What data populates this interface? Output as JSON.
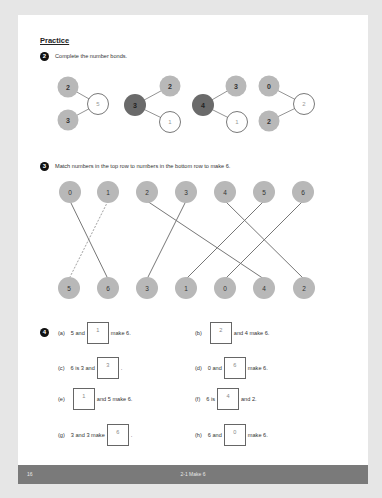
{
  "page": {
    "section_title": "Practice",
    "footer": {
      "page_number": "16",
      "title": "2-1 Make 6"
    }
  },
  "question2": {
    "number": "2",
    "instruction": "Complete the number bonds.",
    "bonds": [
      {
        "layout": "parts-left",
        "whole": "5",
        "parts": [
          "2",
          "3"
        ],
        "filled": "whole"
      },
      {
        "layout": "whole-left",
        "whole": "3",
        "parts": [
          "2",
          "1"
        ],
        "filled": "part"
      },
      {
        "layout": "whole-left",
        "whole": "4",
        "parts": [
          "3",
          "1"
        ],
        "filled": "part"
      },
      {
        "layout": "parts-left",
        "whole": "2",
        "parts": [
          "0",
          "2"
        ],
        "filled": "whole"
      }
    ]
  },
  "question3": {
    "number": "3",
    "instruction": "Match numbers in the top row to numbers in the bottom row to make 6.",
    "top_row": [
      "0",
      "1",
      "2",
      "3",
      "4",
      "5",
      "6"
    ],
    "bottom_row": [
      "5",
      "6",
      "3",
      "1",
      "0",
      "4",
      "2"
    ],
    "matches": [
      {
        "top": "0",
        "bottom": "6",
        "style": "solid"
      },
      {
        "top": "1",
        "bottom": "5",
        "style": "dashed"
      },
      {
        "top": "2",
        "bottom": "4",
        "style": "solid"
      },
      {
        "top": "3",
        "bottom": "3",
        "style": "solid"
      },
      {
        "top": "4",
        "bottom": "2",
        "style": "solid"
      },
      {
        "top": "5",
        "bottom": "1",
        "style": "solid"
      },
      {
        "top": "6",
        "bottom": "0",
        "style": "solid"
      }
    ]
  },
  "question4": {
    "number": "4",
    "items": [
      {
        "label": "(a)",
        "before": "5 and",
        "answer": "1",
        "after": "make 6."
      },
      {
        "label": "(b)",
        "before": "",
        "answer": "2",
        "after": "and 4 make 6."
      },
      {
        "label": "(c)",
        "before": "6 is 3 and",
        "answer": "3",
        "after": "."
      },
      {
        "label": "(d)",
        "before": "0 and",
        "answer": "6",
        "after": "make 6."
      },
      {
        "label": "(e)",
        "before": "",
        "answer": "1",
        "after": "and 5 make 6."
      },
      {
        "label": "(f)",
        "before": "6 is",
        "answer": "4",
        "after": "and 2."
      },
      {
        "label": "(g)",
        "before": "3 and 3 make",
        "answer": "6",
        "after": "."
      },
      {
        "label": "(h)",
        "before": "6 and",
        "answer": "0",
        "after": "make 6."
      }
    ]
  },
  "colors": {
    "part_circle": "#b8b8b8",
    "whole_dark": "#6a6a6a",
    "answer_circle": "#ffffff",
    "line": "#777777",
    "footer_bg": "#7a7a7a"
  }
}
